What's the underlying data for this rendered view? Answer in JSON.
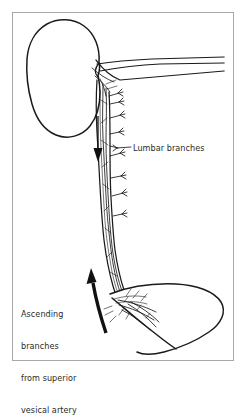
{
  "figure": {
    "background_color": "#ffffff",
    "frame": {
      "border_color": "#a8a8a8",
      "x": 12,
      "y": 12,
      "width": 222,
      "height": 349
    },
    "ink_color": "#1a1a1a",
    "text_color": "#2a2a2a"
  },
  "labels": {
    "lumbar": {
      "text": "Lumbar branches",
      "lines": [
        "Lumbar branches"
      ]
    },
    "ascending": {
      "text": "Ascending branches from superior vesical artery",
      "lines": [
        "Ascending",
        "branches",
        "from superior",
        "vesical artery"
      ],
      "line1": "Ascending",
      "line2": "branches",
      "line3": "from superior",
      "line4": "vesical artery"
    }
  },
  "structures": [
    {
      "name": "kidney",
      "label": "Kidney (bean-shaped outline, upper left)"
    },
    {
      "name": "renal-vessels",
      "label": "Renal artery and vein at hilum"
    },
    {
      "name": "ureter",
      "label": "Ureter descending from kidney to bladder"
    },
    {
      "name": "ureteric-vessel-plexus",
      "label": "Longitudinal anastomotic vessel network on ureter"
    },
    {
      "name": "lumbar-branches",
      "label": "Lumbar branches entering ureter from the right"
    },
    {
      "name": "bladder",
      "label": "Urinary bladder outline, lower right"
    },
    {
      "name": "vesical-plexus",
      "label": "Vessel plexus at ureterovesical junction"
    }
  ],
  "arrows": [
    {
      "name": "descending-flow-arrow",
      "direction": "down",
      "meaning": "Descending arterial flow along the ureter"
    },
    {
      "name": "ascending-flow-arrow",
      "direction": "up",
      "meaning": "Ascending branches from superior vesical artery"
    }
  ]
}
